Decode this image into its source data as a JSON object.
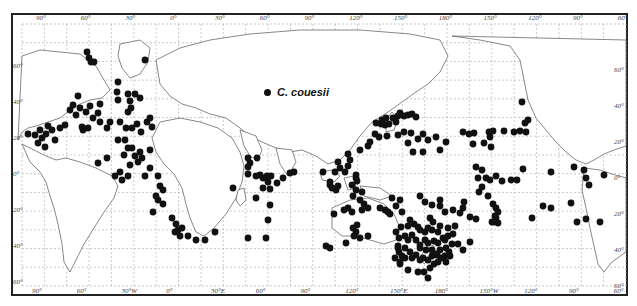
{
  "map": {
    "title": "Distribution map",
    "legend": {
      "symbol": "filled-circle",
      "label": "C. couesii"
    },
    "top_longitude_labels": [
      "90°",
      "60°",
      "30°",
      "0°",
      "30°",
      "60°",
      "90°",
      "120°",
      "150°",
      "180°",
      "150°",
      "120°",
      "90°",
      "60°"
    ],
    "bottom_longitude_labels": [
      "90°",
      "60°",
      "30°W",
      "0°",
      "30°E",
      "60°",
      "90°",
      "120°",
      "150°E",
      "180°",
      "150°W",
      "120°",
      "90°",
      "60°"
    ],
    "left_latitude_labels": [
      "60°",
      "40°",
      "20°",
      "0°",
      "20°",
      "40°",
      "60°"
    ],
    "right_latitude_labels": [
      "60°",
      "40°",
      "20°",
      "0°",
      "20°",
      "40°",
      "60°"
    ],
    "colors": {
      "dot": "#111111",
      "grid": "#9a9a9a",
      "coast": "#6a6a6a",
      "frame": "#222222"
    },
    "occurrence_points_px": [
      [
        87,
        52
      ],
      [
        89,
        58
      ],
      [
        91,
        62
      ],
      [
        94,
        62
      ],
      [
        145,
        60
      ],
      [
        118,
        82
      ],
      [
        117,
        92
      ],
      [
        128,
        94
      ],
      [
        135,
        94
      ],
      [
        118,
        100
      ],
      [
        130,
        101
      ],
      [
        140,
        98
      ],
      [
        131,
        108
      ],
      [
        128,
        112
      ],
      [
        78,
        96
      ],
      [
        70,
        110
      ],
      [
        73,
        105
      ],
      [
        80,
        108
      ],
      [
        76,
        115
      ],
      [
        86,
        112
      ],
      [
        90,
        106
      ],
      [
        98,
        113
      ],
      [
        93,
        118
      ],
      [
        100,
        104
      ],
      [
        100,
        122
      ],
      [
        82,
        127
      ],
      [
        88,
        128
      ],
      [
        83,
        130
      ],
      [
        107,
        128
      ],
      [
        110,
        122
      ],
      [
        120,
        122
      ],
      [
        126,
        128
      ],
      [
        132,
        128
      ],
      [
        137,
        124
      ],
      [
        147,
        122
      ],
      [
        150,
        118
      ],
      [
        152,
        127
      ],
      [
        141,
        132
      ],
      [
        28,
        134
      ],
      [
        35,
        135
      ],
      [
        40,
        130
      ],
      [
        42,
        138
      ],
      [
        38,
        143
      ],
      [
        46,
        134
      ],
      [
        52,
        130
      ],
      [
        48,
        126
      ],
      [
        60,
        128
      ],
      [
        65,
        125
      ],
      [
        55,
        140
      ],
      [
        45,
        147
      ],
      [
        118,
        140
      ],
      [
        125,
        140
      ],
      [
        132,
        148
      ],
      [
        140,
        152
      ],
      [
        150,
        150
      ],
      [
        142,
        158
      ],
      [
        128,
        148
      ],
      [
        124,
        155
      ],
      [
        135,
        156
      ],
      [
        138,
        162
      ],
      [
        130,
        165
      ],
      [
        98,
        163
      ],
      [
        107,
        158
      ],
      [
        120,
        172
      ],
      [
        128,
        176
      ],
      [
        145,
        176
      ],
      [
        150,
        168
      ],
      [
        158,
        176
      ],
      [
        115,
        176
      ],
      [
        122,
        180
      ],
      [
        160,
        186
      ],
      [
        163,
        190
      ],
      [
        156,
        196
      ],
      [
        172,
        218
      ],
      [
        176,
        224
      ],
      [
        178,
        230
      ],
      [
        182,
        228
      ],
      [
        175,
        232
      ],
      [
        180,
        236
      ],
      [
        188,
        236
      ],
      [
        196,
        240
      ],
      [
        205,
        240
      ],
      [
        215,
        232
      ],
      [
        158,
        200
      ],
      [
        163,
        204
      ],
      [
        153,
        212
      ],
      [
        248,
        158
      ],
      [
        250,
        163
      ],
      [
        248,
        167
      ],
      [
        257,
        158
      ],
      [
        248,
        174
      ],
      [
        256,
        176
      ],
      [
        260,
        175
      ],
      [
        263,
        178
      ],
      [
        267,
        176
      ],
      [
        271,
        176
      ],
      [
        268,
        182
      ],
      [
        263,
        188
      ],
      [
        270,
        189
      ],
      [
        277,
        183
      ],
      [
        283,
        178
      ],
      [
        290,
        173
      ],
      [
        294,
        172
      ],
      [
        233,
        188
      ],
      [
        256,
        198
      ],
      [
        270,
        205
      ],
      [
        268,
        220
      ],
      [
        266,
        238
      ],
      [
        248,
        238
      ],
      [
        356,
        178
      ],
      [
        400,
        200
      ],
      [
        330,
        182
      ],
      [
        335,
        172
      ],
      [
        340,
        168
      ],
      [
        345,
        172
      ],
      [
        338,
        162
      ],
      [
        348,
        154
      ],
      [
        360,
        150
      ],
      [
        368,
        146
      ],
      [
        370,
        142
      ],
      [
        375,
        134
      ],
      [
        379,
        137
      ],
      [
        387,
        136
      ],
      [
        376,
        123
      ],
      [
        381,
        124
      ],
      [
        385,
        125
      ],
      [
        382,
        120
      ],
      [
        386,
        118
      ],
      [
        389,
        124
      ],
      [
        393,
        118
      ],
      [
        396,
        122
      ],
      [
        398,
        116
      ],
      [
        400,
        113
      ],
      [
        404,
        116
      ],
      [
        408,
        115
      ],
      [
        412,
        114
      ],
      [
        416,
        117
      ],
      [
        398,
        135
      ],
      [
        404,
        132
      ],
      [
        411,
        133
      ],
      [
        418,
        139
      ],
      [
        408,
        143
      ],
      [
        423,
        134
      ],
      [
        428,
        140
      ],
      [
        436,
        137
      ],
      [
        446,
        142
      ],
      [
        440,
        150
      ],
      [
        423,
        152
      ],
      [
        413,
        152
      ],
      [
        350,
        160
      ],
      [
        348,
        166
      ],
      [
        356,
        175
      ],
      [
        357,
        181
      ],
      [
        352,
        185
      ],
      [
        356,
        190
      ],
      [
        353,
        196
      ],
      [
        362,
        192
      ],
      [
        360,
        200
      ],
      [
        364,
        204
      ],
      [
        368,
        208
      ],
      [
        362,
        210
      ],
      [
        380,
        208
      ],
      [
        385,
        210
      ],
      [
        388,
        212
      ],
      [
        390,
        214
      ],
      [
        323,
        172
      ],
      [
        330,
        185
      ],
      [
        332,
        188
      ],
      [
        336,
        190
      ],
      [
        338,
        186
      ],
      [
        334,
        214
      ],
      [
        344,
        210
      ],
      [
        348,
        208
      ],
      [
        352,
        212
      ],
      [
        357,
        225
      ],
      [
        354,
        236
      ],
      [
        360,
        238
      ],
      [
        368,
        236
      ],
      [
        392,
        198
      ],
      [
        396,
        206
      ],
      [
        402,
        212
      ],
      [
        396,
        232
      ],
      [
        399,
        238
      ],
      [
        356,
        232
      ],
      [
        353,
        228
      ],
      [
        346,
        243
      ],
      [
        330,
        248
      ],
      [
        326,
        246
      ],
      [
        420,
        196
      ],
      [
        425,
        202
      ],
      [
        432,
        205
      ],
      [
        440,
        200
      ],
      [
        440,
        206
      ],
      [
        445,
        212
      ],
      [
        453,
        210
      ],
      [
        460,
        213
      ],
      [
        463,
        208
      ],
      [
        464,
        202
      ],
      [
        470,
        217
      ],
      [
        476,
        219
      ],
      [
        401,
        227
      ],
      [
        408,
        226
      ],
      [
        410,
        220
      ],
      [
        414,
        224
      ],
      [
        418,
        227
      ],
      [
        420,
        230
      ],
      [
        425,
        232
      ],
      [
        428,
        228
      ],
      [
        432,
        230
      ],
      [
        438,
        232
      ],
      [
        440,
        226
      ],
      [
        433,
        222
      ],
      [
        430,
        218
      ],
      [
        405,
        236
      ],
      [
        408,
        240
      ],
      [
        412,
        235
      ],
      [
        416,
        240
      ],
      [
        420,
        245
      ],
      [
        425,
        240
      ],
      [
        428,
        243
      ],
      [
        434,
        241
      ],
      [
        438,
        243
      ],
      [
        443,
        238
      ],
      [
        448,
        236
      ],
      [
        453,
        234
      ],
      [
        448,
        228
      ],
      [
        455,
        226
      ],
      [
        398,
        246
      ],
      [
        399,
        252
      ],
      [
        402,
        256
      ],
      [
        405,
        258
      ],
      [
        400,
        264
      ],
      [
        398,
        248
      ],
      [
        405,
        248
      ],
      [
        410,
        252
      ],
      [
        412,
        258
      ],
      [
        416,
        255
      ],
      [
        420,
        260
      ],
      [
        423,
        258
      ],
      [
        428,
        260
      ],
      [
        432,
        256
      ],
      [
        436,
        254
      ],
      [
        440,
        250
      ],
      [
        446,
        248
      ],
      [
        449,
        252
      ],
      [
        445,
        256
      ],
      [
        452,
        244
      ],
      [
        470,
        242
      ],
      [
        463,
        250
      ],
      [
        446,
        262
      ],
      [
        430,
        268
      ],
      [
        424,
        272
      ],
      [
        428,
        278
      ],
      [
        418,
        272
      ],
      [
        408,
        270
      ],
      [
        400,
        262
      ],
      [
        395,
        258
      ],
      [
        420,
        248
      ],
      [
        426,
        250
      ],
      [
        432,
        250
      ],
      [
        437,
        255
      ],
      [
        441,
        258
      ],
      [
        438,
        262
      ],
      [
        434,
        264
      ],
      [
        445,
        240
      ],
      [
        450,
        256
      ],
      [
        458,
        244
      ],
      [
        463,
        132
      ],
      [
        469,
        134
      ],
      [
        474,
        133
      ],
      [
        489,
        132
      ],
      [
        490,
        137
      ],
      [
        484,
        143
      ],
      [
        491,
        147
      ],
      [
        473,
        144
      ],
      [
        493,
        131
      ],
      [
        514,
        132
      ],
      [
        504,
        131
      ],
      [
        520,
        131
      ],
      [
        526,
        132
      ],
      [
        525,
        123
      ],
      [
        528,
        120
      ],
      [
        522,
        102
      ],
      [
        476,
        167
      ],
      [
        482,
        170
      ],
      [
        478,
        178
      ],
      [
        486,
        178
      ],
      [
        490,
        180
      ],
      [
        496,
        176
      ],
      [
        502,
        181
      ],
      [
        511,
        180
      ],
      [
        517,
        180
      ],
      [
        523,
        169
      ],
      [
        482,
        187
      ],
      [
        479,
        192
      ],
      [
        488,
        196
      ],
      [
        493,
        204
      ],
      [
        496,
        208
      ],
      [
        498,
        212
      ],
      [
        495,
        216
      ],
      [
        496,
        218
      ],
      [
        492,
        222
      ],
      [
        498,
        223
      ],
      [
        494,
        222
      ],
      [
        543,
        206
      ],
      [
        551,
        208
      ],
      [
        571,
        203
      ],
      [
        577,
        222
      ],
      [
        586,
        219
      ],
      [
        600,
        222
      ],
      [
        574,
        167
      ],
      [
        584,
        170
      ],
      [
        586,
        178
      ],
      [
        604,
        175
      ],
      [
        551,
        172
      ],
      [
        589,
        185
      ],
      [
        532,
        218
      ]
    ]
  }
}
